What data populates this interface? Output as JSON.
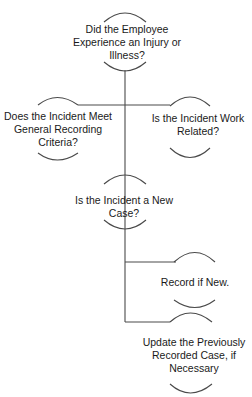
{
  "diagram": {
    "type": "decision-flowchart",
    "line_color": "#4a4a4a",
    "nodes": [
      {
        "id": "injury",
        "label": "Did the Employee Experience an Injury or Illness?"
      },
      {
        "id": "general",
        "label": "Does the Incident Meet General Recording Criteria?"
      },
      {
        "id": "work",
        "label": "Is the Incident Work Related?"
      },
      {
        "id": "newcase",
        "label": "Is the Incident a New Case?"
      },
      {
        "id": "record",
        "label": "Record if New."
      },
      {
        "id": "update",
        "label": "Update the Previously Recorded Case, if Necessary"
      }
    ],
    "edges": [
      {
        "from": "injury",
        "to": "general"
      },
      {
        "from": "injury",
        "to": "work"
      },
      {
        "from": "injury",
        "to": "newcase"
      },
      {
        "from": "newcase",
        "to": "record"
      },
      {
        "from": "newcase",
        "to": "update"
      }
    ]
  }
}
